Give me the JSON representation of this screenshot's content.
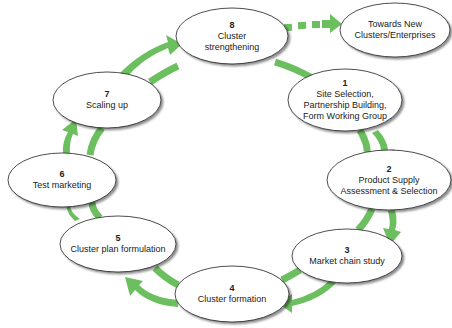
{
  "diagram": {
    "type": "cycle",
    "arrow_color": "#6cbf5e",
    "node_fill": "#ffffff",
    "node_stroke": "#222222",
    "nodes": [
      {
        "id": "1",
        "number": "1",
        "lines": [
          "Site Selection,",
          "Partnership Building,",
          "Form Working Group"
        ],
        "cx": 345,
        "cy": 100,
        "rx": 57,
        "ry": 31
      },
      {
        "id": "2",
        "number": "2",
        "lines": [
          "Product Supply",
          "Assessment & Selection"
        ],
        "cx": 389,
        "cy": 180,
        "rx": 62,
        "ry": 30
      },
      {
        "id": "3",
        "number": "3",
        "lines": [
          "Market chain study"
        ],
        "cx": 347,
        "cy": 256,
        "rx": 55,
        "ry": 27
      },
      {
        "id": "4",
        "number": "4",
        "lines": [
          "Cluster formation"
        ],
        "cx": 232,
        "cy": 294,
        "rx": 57,
        "ry": 28
      },
      {
        "id": "5",
        "number": "5",
        "lines": [
          "Cluster plan formulation"
        ],
        "cx": 118,
        "cy": 244,
        "rx": 58,
        "ry": 28
      },
      {
        "id": "6",
        "number": "6",
        "lines": [
          "Test marketing"
        ],
        "cx": 62,
        "cy": 180,
        "rx": 54,
        "ry": 27
      },
      {
        "id": "7",
        "number": "7",
        "lines": [
          "Scaling up"
        ],
        "cx": 107,
        "cy": 100,
        "rx": 54,
        "ry": 28
      },
      {
        "id": "8",
        "number": "8",
        "lines": [
          "Cluster",
          "strengthening"
        ],
        "cx": 232,
        "cy": 36,
        "rx": 56,
        "ry": 28
      },
      {
        "id": "new",
        "number": "",
        "lines": [
          "Towards New",
          "Clusters/Enterprises"
        ],
        "cx": 395,
        "cy": 30,
        "rx": 55,
        "ry": 27
      }
    ],
    "edges": [
      {
        "from": "1",
        "to": "2"
      },
      {
        "from": "2",
        "to": "3"
      },
      {
        "from": "3",
        "to": "4"
      },
      {
        "from": "4",
        "to": "5"
      },
      {
        "from": "5",
        "to": "6"
      },
      {
        "from": "6",
        "to": "7"
      },
      {
        "from": "7",
        "to": "8"
      },
      {
        "from": "8",
        "to": "1"
      },
      {
        "from": "8",
        "to": "new",
        "style": "dashed"
      }
    ],
    "labels": {
      "n1_num": "1",
      "n1_l1": "Site Selection,",
      "n1_l2": "Partnership Building,",
      "n1_l3": "Form Working Group",
      "n2_num": "2",
      "n2_l1": "Product Supply",
      "n2_l2": "Assessment & Selection",
      "n3_num": "3",
      "n3_l1": "Market chain study",
      "n4_num": "4",
      "n4_l1": "Cluster formation",
      "n5_num": "5",
      "n5_l1": "Cluster plan formulation",
      "n6_num": "6",
      "n6_l1": "Test marketing",
      "n7_num": "7",
      "n7_l1": "Scaling up",
      "n8_num": "8",
      "n8_l1": "Cluster",
      "n8_l2": "strengthening",
      "new_l1": "Towards New",
      "new_l2": "Clusters/Enterprises"
    }
  }
}
